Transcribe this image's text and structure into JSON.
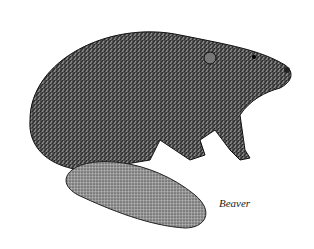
{
  "illustration": {
    "subject": "beaver",
    "style": "pen-and-ink stipple drawing",
    "caption": "Beaver"
  },
  "colors": {
    "ink": "#1a1a1a",
    "paper": "#ffffff"
  }
}
